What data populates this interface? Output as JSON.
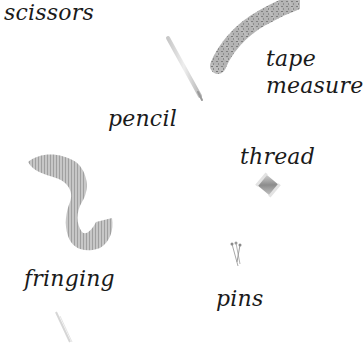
{
  "illustration": {
    "labels": {
      "scissors": "scissors",
      "tape_measure_line1": "tape",
      "tape_measure_line2": "measure",
      "pencil": "pencil",
      "thread": "thread",
      "fringing": "fringing",
      "pins": "pins"
    },
    "items": [
      {
        "name": "scissors",
        "icon": "scissors-icon"
      },
      {
        "name": "pencil",
        "icon": "pencil-icon"
      },
      {
        "name": "tape measure",
        "icon": "tape-measure-icon"
      },
      {
        "name": "thread",
        "icon": "thread-spool-icon"
      },
      {
        "name": "fringing",
        "icon": "fringing-icon"
      },
      {
        "name": "pins",
        "icon": "pins-icon"
      }
    ]
  }
}
